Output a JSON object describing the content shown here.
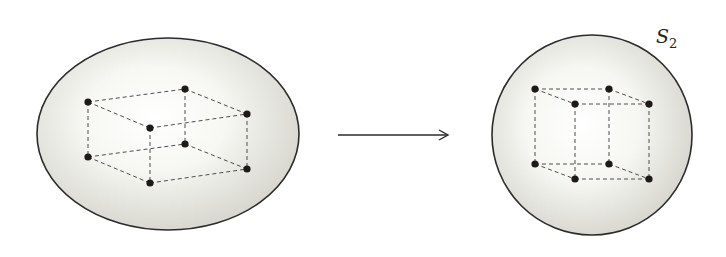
{
  "diagram": {
    "title": "",
    "colors": {
      "surface_fill_center": "#ffffff",
      "surface_fill_edge": "#d9d9d2",
      "outline": "#2b2b2b",
      "edge_dash": "#3a3a3a",
      "vertex": "#1e1a18",
      "arrow": "#2b2b2b"
    },
    "left_surface": {
      "name": "deformed-sphere",
      "label": "",
      "cube": {
        "vertices": [
          {
            "id": "v1"
          },
          {
            "id": "v2"
          },
          {
            "id": "v3"
          },
          {
            "id": "v4"
          },
          {
            "id": "v5"
          },
          {
            "id": "v6"
          },
          {
            "id": "v7"
          },
          {
            "id": "v8"
          }
        ],
        "edges": [
          [
            "v1",
            "v2"
          ],
          [
            "v1",
            "v3"
          ],
          [
            "v2",
            "v4"
          ],
          [
            "v3",
            "v4"
          ],
          [
            "v5",
            "v6"
          ],
          [
            "v5",
            "v7"
          ],
          [
            "v6",
            "v8"
          ],
          [
            "v7",
            "v8"
          ],
          [
            "v1",
            "v5"
          ],
          [
            "v2",
            "v6"
          ],
          [
            "v3",
            "v7"
          ],
          [
            "v4",
            "v8"
          ]
        ]
      }
    },
    "right_surface": {
      "name": "round-sphere",
      "label": "S",
      "label_subscript": "2",
      "cube": {
        "vertices": [
          {
            "id": "v1"
          },
          {
            "id": "v2"
          },
          {
            "id": "v3"
          },
          {
            "id": "v4"
          },
          {
            "id": "v5"
          },
          {
            "id": "v6"
          },
          {
            "id": "v7"
          },
          {
            "id": "v8"
          }
        ],
        "edges": [
          [
            "v1",
            "v2"
          ],
          [
            "v1",
            "v3"
          ],
          [
            "v2",
            "v4"
          ],
          [
            "v3",
            "v4"
          ],
          [
            "v5",
            "v6"
          ],
          [
            "v5",
            "v7"
          ],
          [
            "v6",
            "v8"
          ],
          [
            "v7",
            "v8"
          ],
          [
            "v1",
            "v5"
          ],
          [
            "v2",
            "v6"
          ],
          [
            "v3",
            "v7"
          ],
          [
            "v4",
            "v8"
          ]
        ]
      }
    },
    "arrow": {
      "meaning": "maps-to"
    }
  }
}
